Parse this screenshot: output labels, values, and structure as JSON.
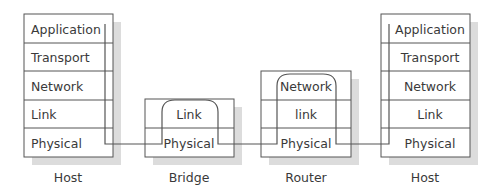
{
  "diagram": {
    "colors": {
      "line": "#555555",
      "shadow": "#d9d9d9",
      "text": "#3a3a3a",
      "background": "#ffffff"
    },
    "nodes": [
      {
        "id": "host-left",
        "caption": "Host",
        "layers": [
          "Application",
          "Transport",
          "Network",
          "Link",
          "Physical"
        ]
      },
      {
        "id": "bridge",
        "caption": "Bridge",
        "layers": [
          "Link",
          "Physical"
        ]
      },
      {
        "id": "router",
        "caption": "Router",
        "layers": [
          "Network",
          "link",
          "Physical"
        ]
      },
      {
        "id": "host-right",
        "caption": "Host",
        "layers": [
          "Application",
          "Transport",
          "Network",
          "Link",
          "Physical"
        ]
      }
    ],
    "connections": [
      {
        "from": "host-left",
        "to": "bridge",
        "layer": "Physical"
      },
      {
        "from": "bridge",
        "to": "router",
        "layer": "Physical"
      },
      {
        "from": "router",
        "to": "host-right",
        "layer": "Physical"
      }
    ]
  }
}
